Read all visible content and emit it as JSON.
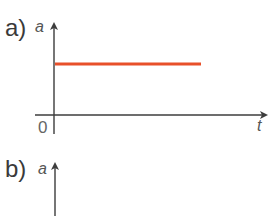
{
  "panels": [
    {
      "label": "a)",
      "y_axis_label": "a",
      "x_axis_label": "t",
      "origin_label": "0",
      "line_color": "#e8502a",
      "description": "constant acceleration: horizontal line"
    },
    {
      "label": "b)",
      "y_axis_label": "a"
    }
  ],
  "colors": {
    "axis": "#3c3c3c",
    "line": "#e8502a"
  }
}
